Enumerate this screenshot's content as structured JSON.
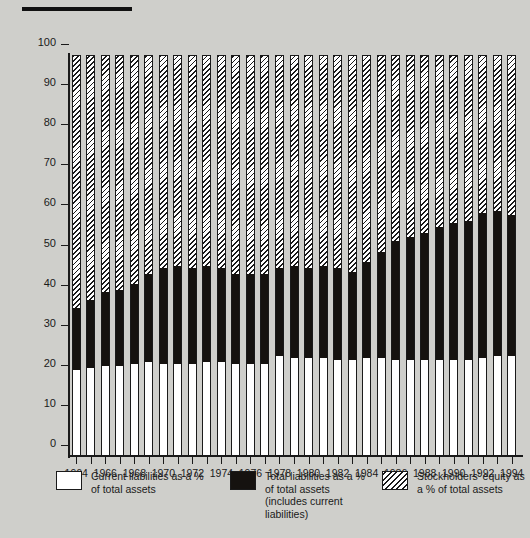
{
  "figure": {
    "top_rule": true,
    "background_color": "#cfcfcb"
  },
  "axes": {
    "y_ticks": [
      0,
      10,
      20,
      30,
      40,
      50,
      60,
      70,
      80,
      90,
      100
    ],
    "y_min": 0,
    "y_max": 100,
    "x_tick_labels": [
      "1964",
      "1966",
      "1968",
      "1970",
      "1972",
      "1974",
      "1976",
      "1978",
      "1980",
      "1982",
      "1984",
      "1986",
      "1988",
      "1990",
      "1992",
      "1994"
    ]
  },
  "legend": {
    "items": [
      {
        "name": "current-liabilities",
        "label": "Current liabilities as a % of total assets",
        "swatch": "white",
        "color": "#ffffff"
      },
      {
        "name": "total-liabilities",
        "label": "Total liabilities as a % of total assets (includes current liabilities)",
        "swatch": "solid-black",
        "color": "#15120f"
      },
      {
        "name": "stockholders-equity",
        "label": "Stockholders' equity as a % of total assets",
        "swatch": "diagonal-hatch",
        "color": "#ffffff"
      }
    ]
  },
  "chart_data": {
    "type": "bar",
    "subtype": "stacked-100-percent",
    "title": "",
    "xlabel": "",
    "ylabel": "",
    "ylim": [
      0,
      100
    ],
    "grid": false,
    "legend_position": "bottom",
    "categories": [
      "1964",
      "1965",
      "1966",
      "1967",
      "1968",
      "1969",
      "1970",
      "1971",
      "1972",
      "1973",
      "1974",
      "1975",
      "1976",
      "1977",
      "1978",
      "1979",
      "1980",
      "1981",
      "1982",
      "1983",
      "1984",
      "1985",
      "1986",
      "1987",
      "1988",
      "1989",
      "1990",
      "1991",
      "1992",
      "1993",
      "1994"
    ],
    "series": [
      {
        "name": "Current liabilities as a % of total assets",
        "pattern": "solid-white",
        "color": "#ffffff",
        "values": [
          21.5,
          22.0,
          22.5,
          22.5,
          23.0,
          23.5,
          23.0,
          23.0,
          23.0,
          23.5,
          23.5,
          23.0,
          23.0,
          23.0,
          25.0,
          24.5,
          24.5,
          24.5,
          24.0,
          24.0,
          24.5,
          24.5,
          24.0,
          24.0,
          24.0,
          24.0,
          24.0,
          24.0,
          24.5,
          25.0,
          25.0
        ]
      },
      {
        "name": "Total liabilities as a % of total assets (includes current liabilities)",
        "pattern": "solid-black",
        "color": "#15120f",
        "values": [
          37.0,
          39.0,
          41.0,
          41.5,
          43.0,
          45.5,
          47.0,
          47.5,
          47.0,
          47.5,
          47.0,
          45.5,
          45.5,
          45.5,
          47.0,
          47.5,
          47.0,
          47.5,
          47.0,
          46.0,
          48.5,
          51.0,
          53.5,
          54.5,
          55.5,
          57.0,
          58.0,
          58.5,
          60.5,
          61.0,
          60.0
        ]
      },
      {
        "name": "Stockholders' equity as a % of total assets",
        "pattern": "diagonal-hatch",
        "color": "#ffffff",
        "values": [
          63.0,
          61.0,
          59.0,
          58.5,
          57.0,
          54.5,
          53.0,
          52.5,
          53.0,
          52.5,
          53.0,
          54.5,
          54.5,
          54.5,
          53.0,
          52.5,
          53.0,
          52.5,
          53.0,
          54.0,
          51.5,
          49.0,
          46.5,
          45.5,
          44.5,
          43.0,
          42.0,
          41.5,
          39.5,
          39.0,
          40.0
        ]
      }
    ]
  }
}
